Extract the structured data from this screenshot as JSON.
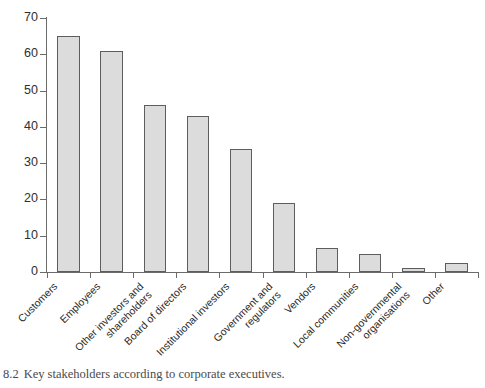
{
  "chart_data": {
    "type": "bar",
    "title": "",
    "xlabel": "",
    "ylabel": "",
    "ylim": [
      0,
      70
    ],
    "yticks": [
      0,
      10,
      20,
      30,
      40,
      50,
      60,
      70
    ],
    "grid": false,
    "legend": null,
    "bar_fill_color": "#dcdcdc",
    "bar_edge_color": "#5d5d5d",
    "axis_color": "#6b6b6b",
    "categories": [
      "Customers",
      "Employees",
      "Other investors and shareholders",
      "Board of directors",
      "Institutional investors",
      "Government and regulators",
      "Vendors",
      "Local communities",
      "Non-governmental organisations",
      "Other"
    ],
    "category_lines": [
      [
        "Customers"
      ],
      [
        "Employees"
      ],
      [
        "Other investors and",
        "shareholders"
      ],
      [
        "Board of directors"
      ],
      [
        "Institutional investors"
      ],
      [
        "Government and",
        "regulators"
      ],
      [
        "Vendors"
      ],
      [
        "Local communities"
      ],
      [
        "Non-governmental",
        "organisations"
      ],
      [
        "Other"
      ]
    ],
    "values": [
      65,
      61,
      46,
      43,
      34,
      19,
      6.5,
      5,
      1,
      2.5
    ]
  },
  "caption": {
    "number": "8.2",
    "text": "Key stakeholders according to corporate executives."
  }
}
